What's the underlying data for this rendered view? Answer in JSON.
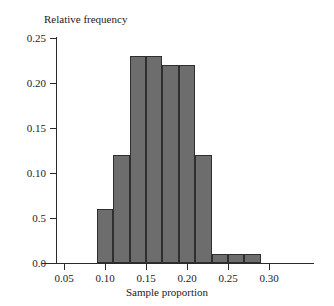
{
  "chart_data": {
    "type": "bar",
    "title": "",
    "ylabel": "Relative frequency",
    "xlabel": "Sample proportion",
    "grid": false,
    "legend": false,
    "bin_width": 0.02,
    "bin_starts": [
      0.09,
      0.11,
      0.13,
      0.15,
      0.17,
      0.19,
      0.21,
      0.23,
      0.25,
      0.27
    ],
    "bin_ends": [
      0.11,
      0.13,
      0.15,
      0.17,
      0.19,
      0.21,
      0.23,
      0.25,
      0.27,
      0.29
    ],
    "categories": [
      "0.09-0.11",
      "0.11-0.13",
      "0.13-0.15",
      "0.15-0.17",
      "0.17-0.19",
      "0.19-0.21",
      "0.21-0.23",
      "0.23-0.25",
      "0.25-0.27",
      "0.27-0.29"
    ],
    "values": [
      0.06,
      0.12,
      0.23,
      0.23,
      0.22,
      0.22,
      0.12,
      0.01,
      0.01,
      0.01
    ],
    "bars": [
      {
        "start": 0.09,
        "end": 0.11,
        "value": 0.06
      },
      {
        "start": 0.11,
        "end": 0.13,
        "value": 0.12
      },
      {
        "start": 0.13,
        "end": 0.15,
        "value": 0.23
      },
      {
        "start": 0.15,
        "end": 0.17,
        "value": 0.23
      },
      {
        "start": 0.17,
        "end": 0.19,
        "value": 0.22
      },
      {
        "start": 0.19,
        "end": 0.21,
        "value": 0.22
      },
      {
        "start": 0.21,
        "end": 0.23,
        "value": 0.12
      },
      {
        "start": 0.23,
        "end": 0.25,
        "value": 0.01
      },
      {
        "start": 0.25,
        "end": 0.27,
        "value": 0.01
      },
      {
        "start": 0.27,
        "end": 0.29,
        "value": 0.01
      }
    ],
    "xlim": [
      0.03,
      0.335
    ],
    "ylim": [
      0.0,
      0.25
    ],
    "yticks": [
      0.0,
      0.05,
      0.1,
      0.15,
      0.2,
      0.25
    ],
    "ytick_labels": [
      "0.0",
      "0.5",
      "0.10",
      "0.15",
      "0.20",
      "0.25"
    ],
    "xticks": [
      0.05,
      0.1,
      0.15,
      0.2,
      0.25,
      0.3
    ],
    "xtick_labels": [
      "0.05",
      "0.10",
      "0.15",
      "0.20",
      "0.25",
      "0.30"
    ],
    "bar_color": "#6d6d6d",
    "bar_edge_color": "#2f2f2f",
    "axis_color": "#2a2a2a"
  }
}
